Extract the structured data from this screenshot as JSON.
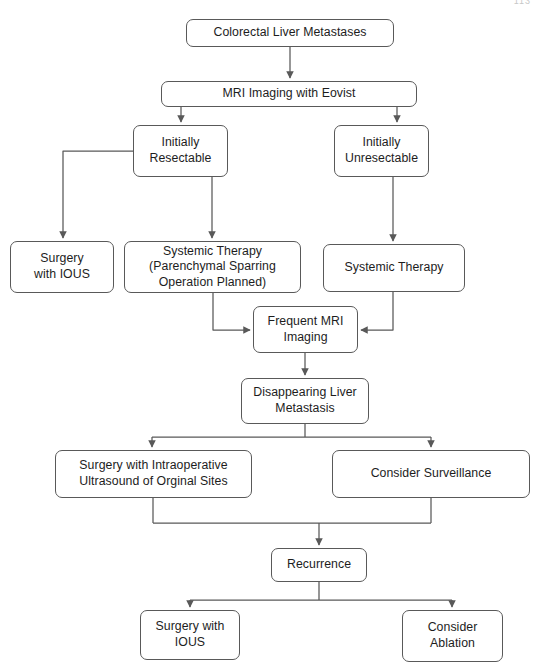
{
  "page": {
    "corner_number": "113",
    "background_color": "#ffffff",
    "line_color": "#595959",
    "text_color": "#1d1d1d"
  },
  "diagram": {
    "type": "flowchart",
    "orientation": "top-down",
    "nodes": [
      {
        "id": "colorectal-liver-metastases",
        "label": "Colorectal Liver Metastases",
        "x": 186,
        "y": 19,
        "w": 208,
        "h": 28
      },
      {
        "id": "mri-imaging-with-eovist",
        "label": "MRI Imaging with Eovist",
        "x": 161,
        "y": 81,
        "w": 256,
        "h": 26
      },
      {
        "id": "initially-resectable",
        "label": "Initially\nResectable",
        "x": 133,
        "y": 125,
        "w": 95,
        "h": 52
      },
      {
        "id": "initially-unresectable",
        "label": "Initially\nUnresectable",
        "x": 334,
        "y": 125,
        "w": 95,
        "h": 52
      },
      {
        "id": "surgery-with-ious-upper",
        "label": "Surgery\nwith IOUS",
        "x": 10,
        "y": 241,
        "w": 104,
        "h": 52
      },
      {
        "id": "systemic-therapy-parenchymal",
        "label": "Systemic Therapy\n(Parenchymal Sparring\nOperation Planned)",
        "x": 124,
        "y": 241,
        "w": 177,
        "h": 52
      },
      {
        "id": "systemic-therapy",
        "label": "Systemic Therapy",
        "x": 323,
        "y": 244,
        "w": 142,
        "h": 48
      },
      {
        "id": "frequent-mri-imaging",
        "label": "Frequent MRI\nImaging",
        "x": 253,
        "y": 306,
        "w": 105,
        "h": 47
      },
      {
        "id": "disappearing-liver-metastasis",
        "label": "Disappearing Liver\nMetastasis",
        "x": 241,
        "y": 378,
        "w": 128,
        "h": 46
      },
      {
        "id": "surgery-with-intraoperative-ultrasound",
        "label": "Surgery with Intraoperative\nUltrasound of Orginal Sites",
        "x": 55,
        "y": 450,
        "w": 197,
        "h": 48
      },
      {
        "id": "consider-surveillance",
        "label": "Consider Surveillance",
        "x": 332,
        "y": 450,
        "w": 198,
        "h": 48
      },
      {
        "id": "recurrence",
        "label": "Recurrence",
        "x": 271,
        "y": 548,
        "w": 96,
        "h": 34
      },
      {
        "id": "surgery-with-ious-lower",
        "label": "Surgery with\nIOUS",
        "x": 140,
        "y": 610,
        "w": 100,
        "h": 50
      },
      {
        "id": "consider-ablation",
        "label": "Consider\nAblation",
        "x": 402,
        "y": 610,
        "w": 101,
        "h": 52
      }
    ],
    "edges": [
      {
        "id": "e1",
        "from": "colorectal-liver-metastases",
        "to": "mri-imaging-with-eovist"
      },
      {
        "id": "e2",
        "from": "mri-imaging-with-eovist",
        "to": "initially-resectable"
      },
      {
        "id": "e3",
        "from": "mri-imaging-with-eovist",
        "to": "initially-unresectable"
      },
      {
        "id": "e4",
        "from": "initially-resectable",
        "to": "surgery-with-ious-upper"
      },
      {
        "id": "e5",
        "from": "initially-resectable",
        "to": "systemic-therapy-parenchymal"
      },
      {
        "id": "e6",
        "from": "initially-unresectable",
        "to": "systemic-therapy"
      },
      {
        "id": "e7",
        "from": "systemic-therapy-parenchymal",
        "to": "frequent-mri-imaging"
      },
      {
        "id": "e8",
        "from": "systemic-therapy",
        "to": "frequent-mri-imaging"
      },
      {
        "id": "e9",
        "from": "frequent-mri-imaging",
        "to": "disappearing-liver-metastasis"
      },
      {
        "id": "e10",
        "from": "disappearing-liver-metastasis",
        "to": "surgery-with-intraoperative-ultrasound"
      },
      {
        "id": "e11",
        "from": "disappearing-liver-metastasis",
        "to": "consider-surveillance"
      },
      {
        "id": "e12",
        "from": "surgery-with-intraoperative-ultrasound",
        "to": "recurrence"
      },
      {
        "id": "e13",
        "from": "consider-surveillance",
        "to": "recurrence"
      },
      {
        "id": "e14",
        "from": "recurrence",
        "to": "surgery-with-ious-lower"
      },
      {
        "id": "e15",
        "from": "recurrence",
        "to": "consider-ablation"
      }
    ]
  }
}
